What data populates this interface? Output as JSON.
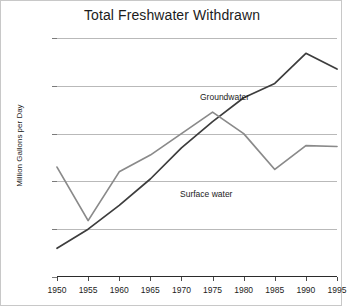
{
  "chart_data": {
    "type": "line",
    "title": "Total Freshwater Withdrawn",
    "xlabel": "",
    "ylabel": "Million Gallons per Day",
    "x": [
      1950,
      1955,
      1960,
      1965,
      1970,
      1975,
      1980,
      1985,
      1990,
      1995
    ],
    "categories": [
      "1950",
      "1955",
      "1960",
      "1965",
      "1970",
      "1975",
      "1980",
      "1985",
      "1990",
      "1995"
    ],
    "xlim": [
      1950,
      1995
    ],
    "ylim": [
      0,
      5000
    ],
    "yticks": [
      0,
      1000,
      2000,
      3000,
      4000,
      5000
    ],
    "ytick_labels": [
      "0",
      "1,000",
      "2,000",
      "3,000",
      "4,000",
      "5,000"
    ],
    "grid": "horizontal",
    "legend": "inline-annotations",
    "series": [
      {
        "name": "Groundwater",
        "color": "#3d3d3d",
        "values": [
          600,
          1000,
          1500,
          2050,
          2700,
          3250,
          3750,
          4050,
          4680,
          4350
        ]
      },
      {
        "name": "Surface water",
        "color": "#8a8a8a",
        "values": [
          2300,
          1180,
          2200,
          2550,
          3000,
          3450,
          3000,
          2250,
          2750,
          2730
        ]
      }
    ],
    "annotations": [
      {
        "text": "Groundwater",
        "series": "Groundwater"
      },
      {
        "text": "Surface water",
        "series": "Surface water"
      }
    ]
  }
}
